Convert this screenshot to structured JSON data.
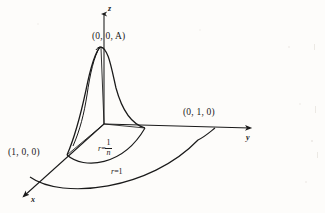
{
  "figure": {
    "background_color": "#fdfcfa",
    "ink_color": "#1a1a1a",
    "axes": {
      "z_label": "z",
      "y_label": "y",
      "x_label": "x",
      "origin": {
        "x": 104,
        "y": 124
      }
    },
    "labels": {
      "peak_point": "(0, 0, A)",
      "y_point": "(0, 1, 0)",
      "x_point": "(1, 0, 0)",
      "inner_radius_prefix": "r",
      "inner_radius_equals": "=",
      "inner_radius_numerator": "1",
      "inner_radius_denominator": "n",
      "outer_radius_prefix": "r",
      "outer_radius_equals": "=",
      "outer_radius_value": "1"
    },
    "geometry": {
      "peak_height_label": "A",
      "inner_disk_radius": "1/n",
      "outer_disk_radius": "1",
      "surface_type": "radial bump / spike over disk of radius 1/n"
    }
  }
}
